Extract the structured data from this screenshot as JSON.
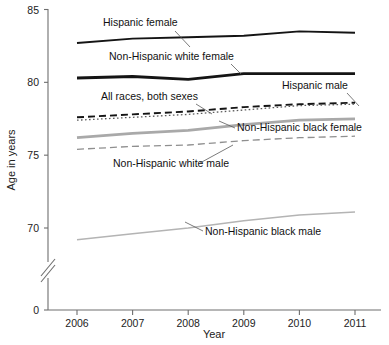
{
  "chart_data": {
    "type": "line",
    "title": "",
    "xlabel": "Year",
    "ylabel": "Age in years",
    "x": [
      2006,
      2007,
      2008,
      2009,
      2010,
      2011
    ],
    "categories": [
      "2006",
      "2007",
      "2008",
      "2009",
      "2010",
      "2011"
    ],
    "xticklabels": [
      "2006",
      "2007",
      "2008",
      "2009",
      "2010",
      "2011"
    ],
    "yticklabels": [
      "0",
      "70",
      "75",
      "80",
      "85"
    ],
    "yticks": [
      0,
      70,
      75,
      80,
      85
    ],
    "ylim": [
      0,
      85
    ],
    "xlim": [
      2006,
      2011
    ],
    "grid": false,
    "legend_position": "inline-annotations",
    "axis_break": true,
    "axis_break_note": "y-axis broken between 0 and 70",
    "series": [
      {
        "name": "Hispanic female",
        "label": "Hispanic female",
        "style": "solid",
        "color": "#141414",
        "width": 1.9,
        "values": [
          82.7,
          83.0,
          83.1,
          83.2,
          83.5,
          83.4
        ]
      },
      {
        "name": "Non-Hispanic white female",
        "label": "Non-Hispanic white female",
        "style": "solid",
        "color": "#141414",
        "width": 2.8,
        "values": [
          80.3,
          80.4,
          80.2,
          80.6,
          80.6,
          80.6
        ]
      },
      {
        "name": "Hispanic male",
        "label": "Hispanic male",
        "style": "dashed",
        "color": "#141414",
        "width": 1.9,
        "values": [
          77.6,
          77.8,
          78.0,
          78.3,
          78.5,
          78.6
        ]
      },
      {
        "name": "All races, both sexes",
        "label": "All races, both sexes",
        "style": "dotted",
        "color": "#5a5a5a",
        "width": 1.3,
        "values": [
          77.4,
          77.6,
          77.8,
          78.1,
          78.4,
          78.5
        ]
      },
      {
        "name": "Non-Hispanic black female",
        "label": "Non-Hispanic black female",
        "style": "solid",
        "color": "#a9a9a9",
        "width": 2.8,
        "values": [
          76.2,
          76.5,
          76.7,
          77.1,
          77.4,
          77.5
        ]
      },
      {
        "name": "Non-Hispanic white male",
        "label": "Non-Hispanic white male",
        "style": "dashed",
        "color": "#8f8f8f",
        "width": 1.3,
        "values": [
          75.4,
          75.6,
          75.7,
          76.0,
          76.2,
          76.3
        ]
      },
      {
        "name": "Non-Hispanic black male",
        "label": "Non-Hispanic black male",
        "style": "solid",
        "color": "#b4b4b4",
        "width": 1.5,
        "values": [
          69.2,
          69.6,
          70.0,
          70.5,
          70.9,
          71.1
        ]
      }
    ],
    "annotations": [
      {
        "text": "Hispanic female",
        "x": 103,
        "y": 26,
        "anchor": "start"
      },
      {
        "text": "Non-Hispanic white female",
        "x": 109,
        "y": 60,
        "anchor": "start"
      },
      {
        "text": "All races, both sexes",
        "x": 101,
        "y": 100,
        "anchor": "start"
      },
      {
        "text": "Hispanic male",
        "x": 282,
        "y": 89,
        "anchor": "start"
      },
      {
        "text": "Non-Hispanic black female",
        "x": 237,
        "y": 131,
        "anchor": "start"
      },
      {
        "text": "Non-Hispanic white male",
        "x": 113,
        "y": 167,
        "anchor": "start"
      },
      {
        "text": "Non-Hispanic black male",
        "x": 205,
        "y": 235,
        "anchor": "start"
      }
    ]
  }
}
